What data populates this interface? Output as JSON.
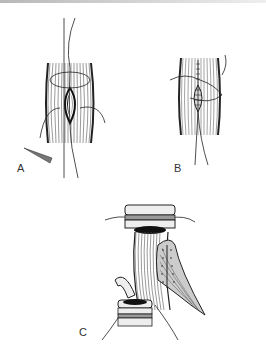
{
  "figure": {
    "panels": [
      {
        "id": "A",
        "label": "A",
        "description": "Muscle with elliptical wound, crossing sutures and needle"
      },
      {
        "id": "B",
        "label": "B",
        "description": "Muscle with closed wound, running stitches and sutures"
      },
      {
        "id": "C",
        "label": "C",
        "description": "Tubular structure with muscle flap wrapped and sutured, two ring segments"
      }
    ]
  }
}
